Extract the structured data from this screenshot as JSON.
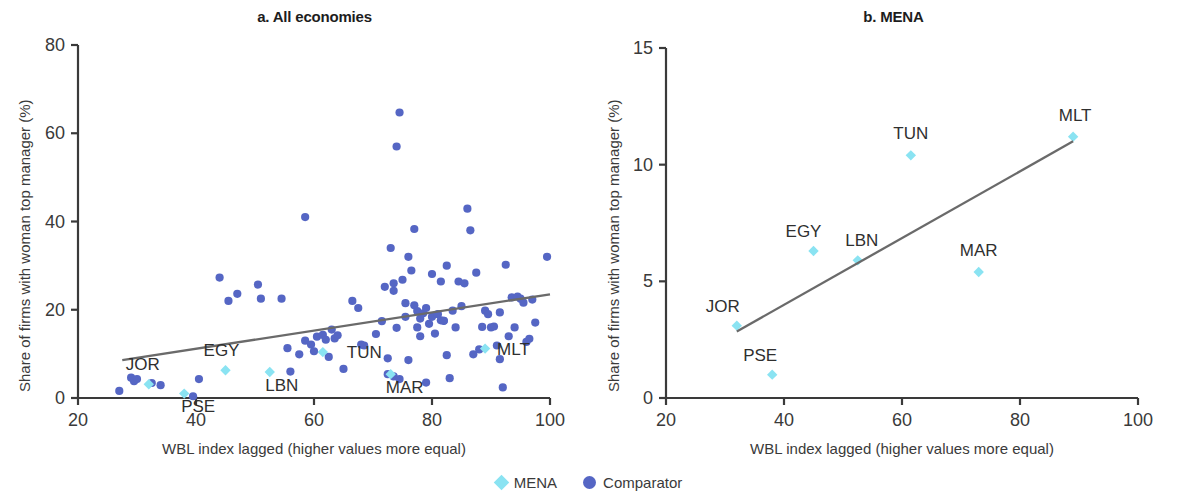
{
  "figure": {
    "legend": [
      {
        "key": "MENA",
        "label": "MENA",
        "marker": "diamond",
        "color": "#8ae3f2"
      },
      {
        "key": "Comparator",
        "label": "Comparator",
        "marker": "circle",
        "color": "#5566c4"
      }
    ]
  },
  "panel_a": {
    "title": "a. All economies",
    "ylabel": "Share of firms with woman top manager (%)",
    "xlabel": "WBL index lagged (higher values more equal)",
    "xticks": [
      "20",
      "40",
      "60",
      "80",
      "100"
    ],
    "yticks": [
      "0",
      "20",
      "40",
      "60",
      "80"
    ]
  },
  "panel_b": {
    "title": "b. MENA",
    "ylabel": "Share of firms with woman top manager (%)",
    "xlabel": "WBL index lagged (higher values more equal)",
    "xticks": [
      "20",
      "40",
      "60",
      "80",
      "100"
    ],
    "yticks": [
      "0",
      "5",
      "10",
      "15"
    ]
  },
  "chart_data": [
    {
      "type": "scatter",
      "panel": "a",
      "title": "a. All economies",
      "xlabel": "WBL index lagged (higher values more equal)",
      "ylabel": "Share of firms with woman top manager (%)",
      "xlim": [
        20,
        100
      ],
      "ylim": [
        0,
        80
      ],
      "xticks": [
        20,
        40,
        60,
        80,
        100
      ],
      "yticks": [
        0,
        20,
        40,
        60,
        80
      ],
      "grid": false,
      "legend_position": "bottom-center",
      "trendline": {
        "x": [
          27.5,
          100
        ],
        "y": [
          8.6,
          23.5
        ],
        "color": "#6a6a6a"
      },
      "series": [
        {
          "name": "MENA",
          "marker": "diamond",
          "color": "#8ae3f2",
          "points": [
            {
              "label": "JOR",
              "x": 32,
              "y": 3.1
            },
            {
              "label": "PSE",
              "x": 38,
              "y": 1.0
            },
            {
              "label": "EGY",
              "x": 45,
              "y": 6.3
            },
            {
              "label": "LBN",
              "x": 52.5,
              "y": 5.9
            },
            {
              "label": "TUN",
              "x": 61.5,
              "y": 10.4
            },
            {
              "label": "MAR",
              "x": 73,
              "y": 5.4
            },
            {
              "label": "MLT",
              "x": 89,
              "y": 11.2
            }
          ]
        },
        {
          "name": "Comparator",
          "marker": "circle",
          "color": "#5566c4",
          "points": [
            [
              27.0,
              1.6
            ],
            [
              29.0,
              4.6
            ],
            [
              29.5,
              3.8
            ],
            [
              30.0,
              4.3
            ],
            [
              32.5,
              3.4
            ],
            [
              34.0,
              2.9
            ],
            [
              39.5,
              0.4
            ],
            [
              40.5,
              4.3
            ],
            [
              44.0,
              27.3
            ],
            [
              45.5,
              22.0
            ],
            [
              47.0,
              23.6
            ],
            [
              50.5,
              25.7
            ],
            [
              51.0,
              22.5
            ],
            [
              54.5,
              22.5
            ],
            [
              55.5,
              11.3
            ],
            [
              56.0,
              6.0
            ],
            [
              57.5,
              9.9
            ],
            [
              58.5,
              41.0
            ],
            [
              58.5,
              13.0
            ],
            [
              59.5,
              12.1
            ],
            [
              60.0,
              10.6
            ],
            [
              60.5,
              13.9
            ],
            [
              61.5,
              14.3
            ],
            [
              62.0,
              13.2
            ],
            [
              62.5,
              9.3
            ],
            [
              63.0,
              15.5
            ],
            [
              63.5,
              13.5
            ],
            [
              64.0,
              14.2
            ],
            [
              65.0,
              6.6
            ],
            [
              66.5,
              22.0
            ],
            [
              67.5,
              20.4
            ],
            [
              68.0,
              12.1
            ],
            [
              68.5,
              11.9
            ],
            [
              70.5,
              14.5
            ],
            [
              71.5,
              17.4
            ],
            [
              72.0,
              25.2
            ],
            [
              72.5,
              9.0
            ],
            [
              72.5,
              5.4
            ],
            [
              73.0,
              34.0
            ],
            [
              73.5,
              4.9
            ],
            [
              73.5,
              24.3
            ],
            [
              73.5,
              26.0
            ],
            [
              74.0,
              15.9
            ],
            [
              74.0,
              57.0
            ],
            [
              74.5,
              64.7
            ],
            [
              74.5,
              4.3
            ],
            [
              75.0,
              26.8
            ],
            [
              75.5,
              18.4
            ],
            [
              75.5,
              21.5
            ],
            [
              76.0,
              8.6
            ],
            [
              76.0,
              32.0
            ],
            [
              76.5,
              28.9
            ],
            [
              77.0,
              38.3
            ],
            [
              77.0,
              21.0
            ],
            [
              77.5,
              16.0
            ],
            [
              77.5,
              19.7
            ],
            [
              78.0,
              18.0
            ],
            [
              78.0,
              14.0
            ],
            [
              78.5,
              19.2
            ],
            [
              79.0,
              20.4
            ],
            [
              79.0,
              3.5
            ],
            [
              79.5,
              16.8
            ],
            [
              80.0,
              18.4
            ],
            [
              80.0,
              28.1
            ],
            [
              80.5,
              14.6
            ],
            [
              81.0,
              19.0
            ],
            [
              81.5,
              17.6
            ],
            [
              81.5,
              26.4
            ],
            [
              82.0,
              17.5
            ],
            [
              82.0,
              17.5
            ],
            [
              82.5,
              30.0
            ],
            [
              82.5,
              9.7
            ],
            [
              83.0,
              4.5
            ],
            [
              83.5,
              19.8
            ],
            [
              84.0,
              16.0
            ],
            [
              84.5,
              26.4
            ],
            [
              85.0,
              20.8
            ],
            [
              85.5,
              26.0
            ],
            [
              86.0,
              42.9
            ],
            [
              86.5,
              38.0
            ],
            [
              87.0,
              9.9
            ],
            [
              87.5,
              28.4
            ],
            [
              88.0,
              11.0
            ],
            [
              88.5,
              16.1
            ],
            [
              89.0,
              19.8
            ],
            [
              89.5,
              19.0
            ],
            [
              90.0,
              16.0
            ],
            [
              90.5,
              16.2
            ],
            [
              91.0,
              11.9
            ],
            [
              91.5,
              19.4
            ],
            [
              91.5,
              8.8
            ],
            [
              92.0,
              2.4
            ],
            [
              92.5,
              30.2
            ],
            [
              93.0,
              14.0
            ],
            [
              93.5,
              22.8
            ],
            [
              94.0,
              16.0
            ],
            [
              94.5,
              23.0
            ],
            [
              95.0,
              22.5
            ],
            [
              95.5,
              21.6
            ],
            [
              96.0,
              12.7
            ],
            [
              96.5,
              13.4
            ],
            [
              97.0,
              22.3
            ],
            [
              97.5,
              17.1
            ],
            [
              99.5,
              32.0
            ]
          ]
        }
      ]
    },
    {
      "type": "scatter",
      "panel": "b",
      "title": "b. MENA",
      "xlabel": "WBL index lagged (higher values more equal)",
      "ylabel": "Share of firms with woman top manager (%)",
      "xlim": [
        20,
        100
      ],
      "ylim": [
        0,
        15
      ],
      "xticks": [
        20,
        40,
        60,
        80,
        100
      ],
      "yticks": [
        0,
        5,
        10,
        15
      ],
      "grid": false,
      "legend_position": "bottom-center",
      "trendline": {
        "x": [
          32,
          89
        ],
        "y": [
          2.85,
          11.0
        ],
        "color": "#6a6a6a"
      },
      "series": [
        {
          "name": "MENA",
          "marker": "diamond",
          "color": "#8ae3f2",
          "points": [
            {
              "label": "JOR",
              "x": 32,
              "y": 3.1
            },
            {
              "label": "PSE",
              "x": 38,
              "y": 1.0
            },
            {
              "label": "EGY",
              "x": 45,
              "y": 6.3
            },
            {
              "label": "LBN",
              "x": 52.5,
              "y": 5.9
            },
            {
              "label": "TUN",
              "x": 61.5,
              "y": 10.4
            },
            {
              "label": "MAR",
              "x": 73,
              "y": 5.4
            },
            {
              "label": "MLT",
              "x": 89,
              "y": 11.2
            }
          ]
        }
      ]
    }
  ]
}
